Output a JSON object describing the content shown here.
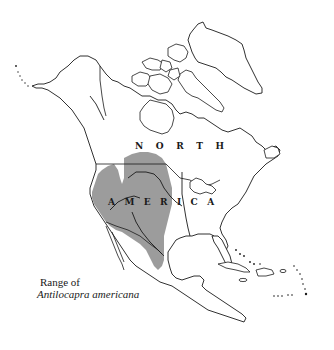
{
  "map": {
    "region": "North America",
    "colors": {
      "range_fill": "#9c9c9c",
      "outline": "#1a1a1a",
      "background": "#ffffff"
    },
    "labels": {
      "north": [
        "N",
        "O",
        "R",
        "T",
        "H"
      ],
      "america": [
        "A",
        "M",
        "E",
        "R",
        "I",
        "C",
        "A"
      ]
    },
    "legend": {
      "line1": "Range of",
      "line2": "Antilocapra americana"
    }
  }
}
